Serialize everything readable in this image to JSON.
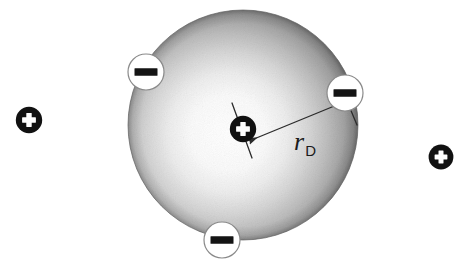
{
  "figure": {
    "title": "Debye shielding of a positive test charge in a plasma",
    "background_color": "#ffffff",
    "width": 469,
    "height": 268
  },
  "colors": {
    "ink": "#1a1a1a",
    "charge_fill": "#111111",
    "charge_glyph": "#ffffff",
    "minus_fill": "#ffffff",
    "minus_stroke": "#8a8a8a",
    "minus_bar": "#141414",
    "sphere_center": "#ffffff",
    "sphere_mid": "#cfcfcf",
    "sphere_edge": "#6e6e6e",
    "line": "#2b2b2b"
  },
  "sphere": {
    "label": "debye-sphere",
    "cx": 243,
    "cy": 125,
    "r": 115,
    "highlight_cx": 228,
    "highlight_cy": 133,
    "description": "shaded sphere, bright at centre fading to dark at the rim"
  },
  "radius_dimension": {
    "label_text": "r",
    "label_subscript": "D",
    "label_x": 294,
    "label_y": 150,
    "start_x": 249,
    "start_y": 141,
    "end_x": 349,
    "end_y": 100,
    "tick_near": {
      "x1": 232,
      "y1": 103,
      "x2": 252,
      "y2": 158
    },
    "tick_far": {
      "x1": 342,
      "y1": 89,
      "x2": 357,
      "y2": 125
    }
  },
  "charges": {
    "center": {
      "name": "center-positive-charge",
      "glyph": "+",
      "cx": 243,
      "cy": 129,
      "r": 13
    },
    "external_positive": [
      {
        "name": "external-positive-charge-left",
        "glyph": "+",
        "cx": 29,
        "cy": 120,
        "r": 13
      },
      {
        "name": "external-positive-charge-right",
        "glyph": "+",
        "cx": 441,
        "cy": 157,
        "r": 12
      }
    ],
    "negative": [
      {
        "name": "negative-charge-top-left",
        "glyph": "–",
        "cx": 146,
        "cy": 72,
        "r": 18
      },
      {
        "name": "negative-charge-right",
        "glyph": "–",
        "cx": 345,
        "cy": 93,
        "r": 18
      },
      {
        "name": "negative-charge-bottom",
        "glyph": "–",
        "cx": 222,
        "cy": 240,
        "r": 18
      }
    ]
  }
}
